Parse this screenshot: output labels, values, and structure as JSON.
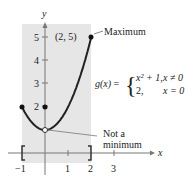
{
  "chart_data": {
    "type": "line",
    "title": "",
    "function_label": "g(x)",
    "piecewise": [
      {
        "expr": "x² + 1,",
        "cond": "x ≠ 0"
      },
      {
        "expr": "2,",
        "cond": "x = 0"
      }
    ],
    "xlabel": "x",
    "ylabel": "y",
    "xlim": [
      -1,
      3
    ],
    "ylim": [
      0,
      5
    ],
    "x_ticks": [
      "−1",
      "1",
      "2",
      "3"
    ],
    "y_ticks": [
      "2",
      "3",
      "4",
      "5"
    ],
    "interval": [
      -1,
      2
    ],
    "interval_brackets": [
      "[",
      "]"
    ],
    "series": [
      {
        "name": "x^2+1",
        "x": [
          -1,
          -0.5,
          0,
          0.5,
          1,
          1.5,
          2
        ],
        "y": [
          2,
          1.25,
          1,
          1.25,
          2,
          3.25,
          5
        ]
      }
    ],
    "points": [
      {
        "x": -1,
        "y": 2,
        "filled": true
      },
      {
        "x": 0,
        "y": 2,
        "filled": true
      },
      {
        "x": 0,
        "y": 1,
        "filled": false
      },
      {
        "x": 2,
        "y": 5,
        "filled": true
      }
    ],
    "annotations": {
      "max_point": "(2, 5)",
      "max_label": "Maximum",
      "min_label_line1": "Not a",
      "min_label_line2": "minimum"
    },
    "shaded_region": {
      "x": [
        -1,
        2
      ]
    }
  }
}
